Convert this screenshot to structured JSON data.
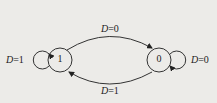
{
  "diagram": {
    "type": "state-transition",
    "states": [
      {
        "id": "s1",
        "label": "1"
      },
      {
        "id": "s0",
        "label": "0"
      }
    ],
    "transitions": [
      {
        "from": "1",
        "to": "0",
        "var": "D",
        "eq": "=0",
        "label": "D=0"
      },
      {
        "from": "0",
        "to": "1",
        "var": "D",
        "eq": "=1",
        "label": "D=1"
      },
      {
        "from": "1",
        "to": "1",
        "var": "D",
        "eq": "=1",
        "label": "D=1"
      },
      {
        "from": "0",
        "to": "0",
        "var": "D",
        "eq": "=0",
        "label": "D=0"
      }
    ]
  }
}
